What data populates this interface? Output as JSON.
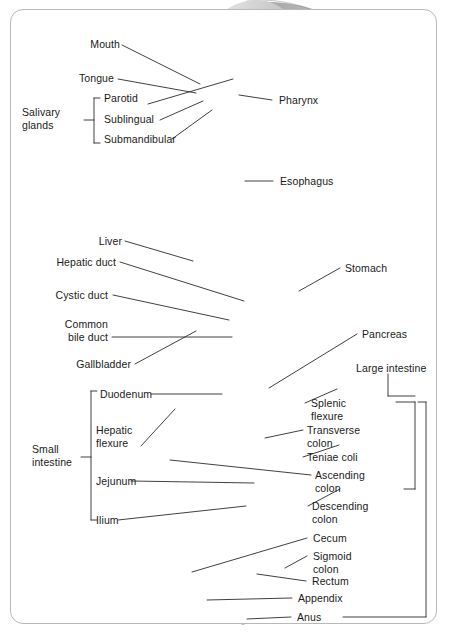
{
  "figure": {
    "border_color": "#b9b9b9",
    "background": "#ffffff",
    "text_color": "#1a1a1a"
  },
  "labels": {
    "mouth": "Mouth",
    "tongue": "Tongue",
    "salivary_glands_l1": "Salivary",
    "salivary_glands_l2": "glands",
    "parotid": "Parotid",
    "sublingual": "Sublingual",
    "submandibular": "Submandibular",
    "pharynx": "Pharynx",
    "esophagus": "Esophagus",
    "liver": "Liver",
    "hepatic_duct": "Hepatic duct",
    "cystic_duct": "Cystic duct",
    "common_bile_duct_l1": "Common",
    "common_bile_duct_l2": "bile duct",
    "gallbladder": "Gallbladder",
    "stomach": "Stomach",
    "pancreas": "Pancreas",
    "large_intestine": "Large intestine",
    "small_intestine_l1": "Small",
    "small_intestine_l2": "intestine",
    "duodenum": "Duodenum",
    "hepatic_flexure_l1": "Hepatic",
    "hepatic_flexure_l2": "flexure",
    "jejunum": "Jejunum",
    "ilium": "Ilium",
    "splenic_flexure_l1": "Splenic",
    "splenic_flexure_l2": "flexure",
    "transverse_colon_l1": "Transverse",
    "transverse_colon_l2": "colon",
    "teniae_coli": "Teniae coli",
    "ascending_colon_l1": "Ascending",
    "ascending_colon_l2": "colon",
    "descending_colon_l1": "Descending",
    "descending_colon_l2": "colon",
    "cecum": "Cecum",
    "sigmoid_colon_l1": "Sigmoid",
    "sigmoid_colon_l2": "colon",
    "rectum": "Rectum",
    "appendix": "Appendix",
    "anus": "Anus"
  },
  "groups": {
    "salivary_glands_members": [
      "Parotid",
      "Sublingual",
      "Submandibular"
    ],
    "small_intestine_members": [
      "Duodenum",
      "Jejunum",
      "Ilium"
    ],
    "large_intestine_members": [
      "Splenic flexure",
      "Transverse colon",
      "Teniae coli",
      "Ascending colon",
      "Descending colon",
      "Cecum",
      "Sigmoid colon",
      "Rectum",
      "Anus"
    ]
  },
  "structures": [
    "Mouth",
    "Tongue",
    "Parotid",
    "Sublingual",
    "Submandibular",
    "Pharynx",
    "Esophagus",
    "Liver",
    "Hepatic duct",
    "Cystic duct",
    "Common bile duct",
    "Gallbladder",
    "Stomach",
    "Pancreas",
    "Duodenum",
    "Hepatic flexure",
    "Jejunum",
    "Ilium",
    "Splenic flexure",
    "Transverse colon",
    "Teniae coli",
    "Ascending colon",
    "Descending colon",
    "Cecum",
    "Sigmoid colon",
    "Rectum",
    "Appendix",
    "Anus"
  ],
  "palette": {
    "liver": "#565656",
    "stomach": "#9c9c9c",
    "colon": "#8b8b8b",
    "small_intestine": "#c2c2c2",
    "pancreas": "#cccccc",
    "esophagus": "#a8a8a8",
    "skin": "#d8d8d8",
    "leader_line": "#2b2b2b"
  }
}
